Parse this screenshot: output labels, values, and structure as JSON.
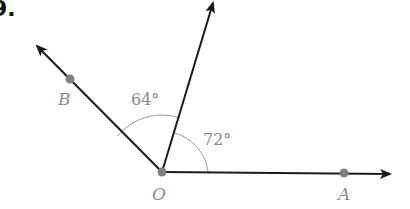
{
  "question": {
    "number_fragment": "9."
  },
  "diagram": {
    "vertex": {
      "label": "O",
      "x": 162,
      "y": 172
    },
    "rays": [
      {
        "name": "OA",
        "end_x": 390,
        "end_y": 174,
        "point_label": "A",
        "point_x": 344,
        "point_y": 173
      },
      {
        "name": "OB",
        "end_x": 37,
        "end_y": 46,
        "point_label": "B",
        "point_x": 70,
        "point_y": 79
      },
      {
        "name": "unlabeled-ray",
        "end_x": 213,
        "end_y": 3
      }
    ],
    "angles": [
      {
        "between": "OB and upper ray",
        "value": "64°"
      },
      {
        "between": "upper ray and OA",
        "value": "72°"
      }
    ],
    "colors": {
      "line": "#1a1a1a",
      "arc": "#9a9a9a",
      "point": "#808080",
      "label": "#8a8a8a"
    }
  }
}
